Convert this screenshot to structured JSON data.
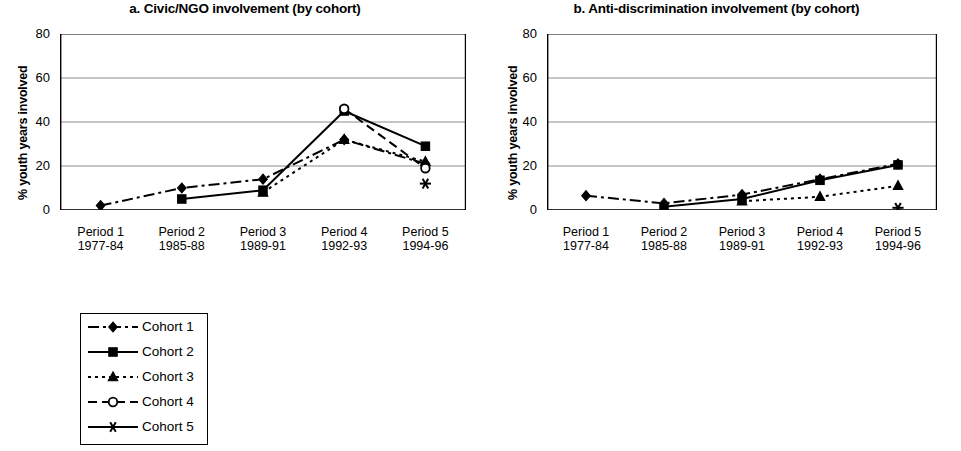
{
  "figure": {
    "ylabel": "% youth years involved"
  },
  "panels": [
    {
      "id": "a",
      "title": "a. Civic/NGO involvement (by cohort)"
    },
    {
      "id": "b",
      "title": "b. Anti-discrimination involvement (by cohort)"
    }
  ],
  "legend": {
    "items": [
      {
        "label": "Cohort 1",
        "marker": "diamond",
        "dash": "dashdot"
      },
      {
        "label": "Cohort 2",
        "marker": "square",
        "dash": "solid"
      },
      {
        "label": "Cohort 3",
        "marker": "triangle",
        "dash": "dotted"
      },
      {
        "label": "Cohort 4",
        "marker": "circle-open",
        "dash": "dashed"
      },
      {
        "label": "Cohort 5",
        "marker": "star",
        "dash": "solid"
      }
    ]
  },
  "colors": {
    "line": "#000000",
    "grid": "#808080",
    "axis": "#000000",
    "background": "#ffffff"
  },
  "chart_data": [
    {
      "type": "line",
      "title": "a. Civic/NGO involvement (by cohort)",
      "xlabel": "",
      "ylabel": "% youth years involved",
      "ylim": [
        0,
        80
      ],
      "yticks": [
        0,
        20,
        40,
        60,
        80
      ],
      "grid": true,
      "legend_position": "below-left-external",
      "categories": [
        "Period 1",
        "Period 2",
        "Period 3",
        "Period 4",
        "Period 5"
      ],
      "category_sublabels": [
        "1977-84",
        "1985-88",
        "1989-91",
        "1992-93",
        "1994-96"
      ],
      "series": [
        {
          "name": "Cohort 1",
          "marker": "diamond",
          "dash": "dashdot",
          "values": [
            2,
            10,
            14,
            32,
            21
          ]
        },
        {
          "name": "Cohort 2",
          "marker": "square",
          "dash": "solid",
          "values": [
            null,
            5,
            9,
            45,
            29
          ]
        },
        {
          "name": "Cohort 3",
          "marker": "triangle",
          "dash": "dotted",
          "values": [
            null,
            null,
            8,
            32,
            22
          ]
        },
        {
          "name": "Cohort 4",
          "marker": "circle-open",
          "dash": "dashed",
          "values": [
            null,
            null,
            null,
            46,
            19
          ]
        },
        {
          "name": "Cohort 5",
          "marker": "star",
          "dash": "solid",
          "values": [
            null,
            null,
            null,
            null,
            12
          ]
        }
      ]
    },
    {
      "type": "line",
      "title": "b. Anti-discrimination involvement (by cohort)",
      "xlabel": "",
      "ylabel": "% youth years involved",
      "ylim": [
        0,
        80
      ],
      "yticks": [
        0,
        20,
        40,
        60,
        80
      ],
      "grid": true,
      "legend_position": "shared",
      "categories": [
        "Period 1",
        "Period 2",
        "Period 3",
        "Period 4",
        "Period 5"
      ],
      "category_sublabels": [
        "1977-84",
        "1985-88",
        "1989-91",
        "1992-93",
        "1994-96"
      ],
      "series": [
        {
          "name": "Cohort 1",
          "marker": "diamond",
          "dash": "dashdot",
          "values": [
            6.5,
            3,
            7,
            14,
            21
          ]
        },
        {
          "name": "Cohort 2",
          "marker": "square",
          "dash": "solid",
          "values": [
            null,
            1.5,
            5,
            13.5,
            20.5
          ]
        },
        {
          "name": "Cohort 3",
          "marker": "triangle",
          "dash": "dotted",
          "values": [
            null,
            null,
            4,
            6,
            11
          ]
        },
        {
          "name": "Cohort 4",
          "marker": "circle-open",
          "dash": "dashed",
          "values": [
            null,
            null,
            null,
            null,
            null
          ]
        },
        {
          "name": "Cohort 5",
          "marker": "star",
          "dash": "solid",
          "values": [
            null,
            null,
            null,
            null,
            1
          ]
        }
      ]
    }
  ]
}
